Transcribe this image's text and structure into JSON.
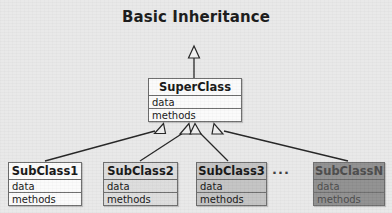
{
  "diagram": {
    "title": "Basic Inheritance",
    "type": "uml-class-diagram",
    "background_color": "#e9e9e9",
    "border_color": "#6b6b6b",
    "ellipsis": "...",
    "superclass": {
      "name": "SuperClass",
      "attributes_label": "data",
      "methods_label": "methods",
      "fill_color": "#fbfbfb",
      "x": 148,
      "y": 78,
      "width": 94,
      "height": 44
    },
    "subclasses": [
      {
        "name": "SubClass1",
        "attributes_label": "data",
        "methods_label": "methods",
        "fill_color": "#fbfbfb",
        "x": 8,
        "y": 162,
        "width": 74,
        "height": 44
      },
      {
        "name": "SubClass2",
        "attributes_label": "data",
        "methods_label": "methods",
        "fill_color": "#dcdcdc",
        "x": 103,
        "y": 162,
        "width": 75,
        "height": 44
      },
      {
        "name": "SubClass3",
        "attributes_label": "data",
        "methods_label": "methods",
        "fill_color": "#c3c3c3",
        "x": 196,
        "y": 162,
        "width": 71,
        "height": 44
      },
      {
        "name": "SubClassN",
        "attributes_label": "data",
        "methods_label": "methods",
        "fill_color": "#8f8f8f",
        "x": 313,
        "y": 162,
        "width": 72,
        "height": 44
      }
    ],
    "parent_link": {
      "description": "generalization arrow rising from SuperClass to an unshown ancestor",
      "x": 194,
      "y_top": 47,
      "y_bottom": 78
    }
  }
}
